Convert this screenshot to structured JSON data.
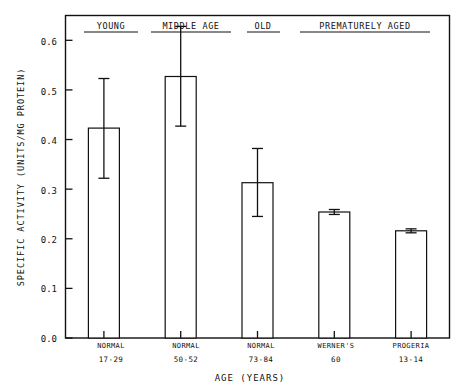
{
  "chart_data": {
    "type": "bar",
    "title": "",
    "xlabel": "AGE (YEARS)",
    "ylabel": "SPECIFIC ACTIVITY (UNITS/MG PROTEIN)",
    "ylim": [
      0.0,
      0.65
    ],
    "yticks": [
      0.0,
      0.1,
      0.2,
      0.3,
      0.4,
      0.5,
      0.6
    ],
    "ytick_labels": [
      "0.0",
      "0.1",
      "0.2",
      "0.3",
      "0.4",
      "0.5",
      "0.6"
    ],
    "grid": false,
    "legend": "none",
    "bar_style": "open-outline",
    "categories": [
      "NORMAL",
      "NORMAL",
      "NORMAL",
      "WERNER'S",
      "PROGERIA"
    ],
    "category_ages": [
      "17-29",
      "50-52",
      "73-84",
      "60",
      "13-14"
    ],
    "values": [
      0.423,
      0.527,
      0.313,
      0.254,
      0.216
    ],
    "errors_low": [
      0.322,
      0.427,
      0.245,
      0.249,
      0.212
    ],
    "errors_high": [
      0.523,
      0.628,
      0.382,
      0.259,
      0.22
    ],
    "groups": [
      {
        "label": "YOUNG",
        "underline": true,
        "bars": [
          0
        ]
      },
      {
        "label": "MIDDLE AGE",
        "underline": true,
        "bars": [
          1
        ]
      },
      {
        "label": "OLD",
        "underline": true,
        "bars": [
          2
        ]
      },
      {
        "label": "PREMATURELY AGED",
        "underline": true,
        "bars": [
          3,
          4
        ]
      }
    ],
    "series": [
      {
        "name": "Specific Activity",
        "values": [
          0.423,
          0.527,
          0.313,
          0.254,
          0.216
        ]
      }
    ]
  },
  "axes": {
    "y_tick_0": "0.0",
    "y_tick_1": "0.1",
    "y_tick_2": "0.2",
    "y_tick_3": "0.3",
    "y_tick_4": "0.4",
    "y_tick_5": "0.5",
    "y_tick_6": "0.6",
    "y_axis_title": "SPECIFIC ACTIVITY (UNITS/MG PROTEIN)",
    "x_axis_title": "AGE (YEARS)"
  },
  "groups": {
    "g0": "YOUNG",
    "g1": "MIDDLE AGE",
    "g2": "OLD",
    "g3": "PREMATURELY AGED"
  },
  "categories": {
    "c0_name": "NORMAL",
    "c0_age": "17-29",
    "c1_name": "NORMAL",
    "c1_age": "50-52",
    "c2_name": "NORMAL",
    "c2_age": "73-84",
    "c3_name": "WERNER'S",
    "c3_age": "60",
    "c4_name": "PROGERIA",
    "c4_age": "13-14"
  },
  "colors": {
    "ink": "#111111",
    "background": "#ffffff",
    "bar_fill": "#ffffff",
    "bar_stroke": "#111111"
  }
}
